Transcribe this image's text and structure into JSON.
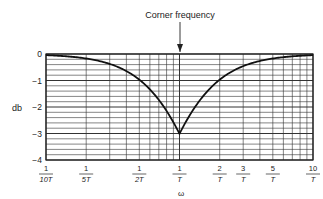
{
  "chart_data": {
    "type": "line",
    "title": "Corner frequency",
    "xlabel": "ω",
    "ylabel": "db",
    "x_scale": "log",
    "x_units": "1/T",
    "xlim": [
      0.1,
      10
    ],
    "ylim": [
      -4,
      0
    ],
    "grid": true,
    "legend": "none",
    "yticks": [
      {
        "value": 0,
        "label": "0"
      },
      {
        "value": -1,
        "label": "−1"
      },
      {
        "value": -2,
        "label": "−2"
      },
      {
        "value": -3,
        "label": "−3"
      },
      {
        "value": -4,
        "label": "−4"
      }
    ],
    "xticks": [
      {
        "value": 0.1,
        "num": "1",
        "den": "10T"
      },
      {
        "value": 0.2,
        "num": "1",
        "den": "5T"
      },
      {
        "value": 0.5,
        "num": "1",
        "den": "2T"
      },
      {
        "value": 1,
        "num": "1",
        "den": "T"
      },
      {
        "value": 2,
        "num": "2",
        "den": "T"
      },
      {
        "value": 3,
        "num": "3",
        "den": "T"
      },
      {
        "value": 5,
        "num": "5",
        "den": "T"
      },
      {
        "value": 10,
        "num": "10",
        "den": "T"
      }
    ],
    "annotation": {
      "text": "Corner frequency",
      "x": 1,
      "arrow": true
    },
    "series": [
      {
        "name": "error curve",
        "x": [
          0.1,
          0.2,
          0.3,
          0.5,
          0.7,
          1,
          1.4,
          2,
          3,
          5,
          7,
          10
        ],
        "values": [
          -0.04,
          -0.17,
          -0.37,
          -0.97,
          -1.73,
          -3.0,
          -1.73,
          -0.97,
          -0.46,
          -0.17,
          -0.09,
          -0.04
        ]
      }
    ]
  }
}
